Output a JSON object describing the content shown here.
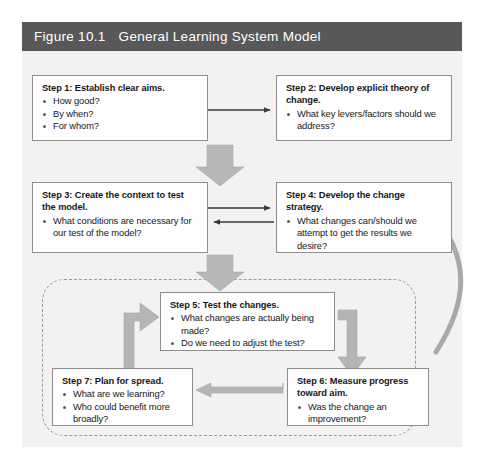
{
  "figure": {
    "number": "Figure 10.1",
    "title": "General Learning System Model",
    "header_color": "#58585a",
    "panel_color": "#f3f2f0",
    "arrow_color": "#a6a6a6",
    "box_border_color": "#8d8d8d"
  },
  "steps": [
    {
      "id": "step1",
      "heading": "Step 1: Establish clear aims.",
      "bullets": [
        "How good?",
        "By when?",
        "For whom?"
      ]
    },
    {
      "id": "step2",
      "heading": "Step 2: Develop explicit theory of change.",
      "bullets": [
        "What key levers/factors should we address?"
      ]
    },
    {
      "id": "step3",
      "heading": "Step 3: Create the context to test the model.",
      "bullets": [
        "What conditions are necessary for our test of the model?"
      ]
    },
    {
      "id": "step4",
      "heading": "Step 4: Develop the change strategy.",
      "bullets": [
        "What changes can/should we attempt to get the results we desire?"
      ]
    },
    {
      "id": "step5",
      "heading": "Step 5: Test the changes.",
      "bullets": [
        "What changes are actually being made?",
        "Do we need to adjust the test?"
      ]
    },
    {
      "id": "step6",
      "heading": "Step 6: Measure progress toward aim.",
      "bullets": [
        "Was the change an improvement?"
      ]
    },
    {
      "id": "step7",
      "heading": "Step 7: Plan for spread.",
      "bullets": [
        "What are we learning?",
        "Who could benefit more broadly?"
      ]
    }
  ],
  "connectors": [
    {
      "name": "step1-to-step2",
      "style": "thin-line-arrow",
      "direction": "right"
    },
    {
      "name": "step1-to-step3",
      "style": "block-arrow",
      "direction": "down"
    },
    {
      "name": "step3-to-step4",
      "style": "thin-line-arrow",
      "direction": "right"
    },
    {
      "name": "step4-to-step3",
      "style": "thin-line-arrow",
      "direction": "left"
    },
    {
      "name": "step3-to-pdsa-loop",
      "style": "block-arrow",
      "direction": "down"
    },
    {
      "name": "step7-to-step5",
      "style": "elbow-arrow",
      "direction": "up-right"
    },
    {
      "name": "step5-to-step6",
      "style": "elbow-arrow",
      "direction": "right-down"
    },
    {
      "name": "step6-to-step7",
      "style": "block-arrow",
      "direction": "left"
    },
    {
      "name": "loop-back-to-step4",
      "style": "curved-arrow",
      "direction": "up"
    }
  ]
}
